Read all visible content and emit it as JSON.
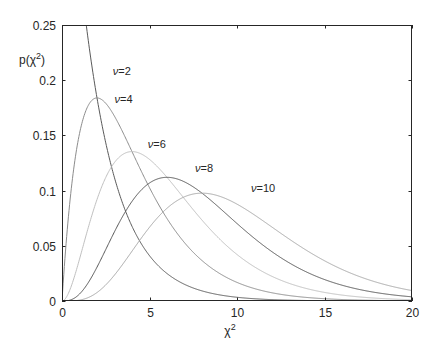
{
  "chart_data": {
    "type": "line",
    "title": "",
    "xlabel": "χ²",
    "ylabel": "p(χ²)",
    "xlim": [
      0,
      20
    ],
    "ylim": [
      0,
      0.25
    ],
    "grid": false,
    "legend": "inline labels",
    "x_ticks": [
      "0",
      "5",
      "10",
      "15",
      "20"
    ],
    "y_ticks": [
      "0",
      "0.05",
      "0.1",
      "0.15",
      "0.2",
      "0.25"
    ],
    "series": [
      {
        "name": "ν=2",
        "df": 2,
        "peak": {
          "x": 0,
          "y": 0.5
        },
        "color": "#5a5a5a"
      },
      {
        "name": "ν=4",
        "df": 4,
        "peak": {
          "x": 2,
          "y": 0.184
        },
        "color": "#8c8c8c"
      },
      {
        "name": "ν=6",
        "df": 6,
        "peak": {
          "x": 4,
          "y": 0.135
        },
        "color": "#c0c0c0"
      },
      {
        "name": "ν=8",
        "df": 8,
        "peak": {
          "x": 6,
          "y": 0.112
        },
        "color": "#555555"
      },
      {
        "name": "ν=10",
        "df": 10,
        "peak": {
          "x": 8,
          "y": 0.098
        },
        "color": "#a8a8a8"
      }
    ],
    "annotations": [
      {
        "text": "ν=2",
        "x": 2.9,
        "y": 0.205
      },
      {
        "text": "ν=4",
        "x": 3.0,
        "y": 0.179
      },
      {
        "text": "ν=6",
        "x": 4.9,
        "y": 0.139
      },
      {
        "text": "ν=8",
        "x": 7.6,
        "y": 0.117
      },
      {
        "text": "ν=10",
        "x": 10.8,
        "y": 0.099
      }
    ]
  }
}
